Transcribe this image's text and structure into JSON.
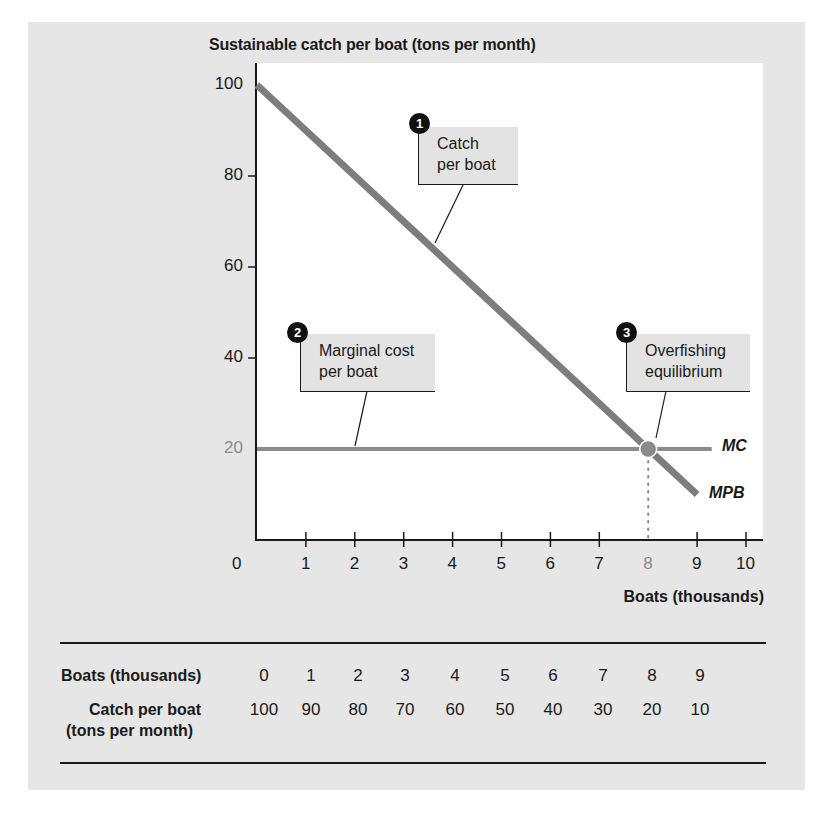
{
  "chart_data": {
    "type": "line",
    "title": "",
    "ylabel": "Sustainable catch per boat (tons per month)",
    "xlabel": "Boats (thousands)",
    "xlim": [
      0,
      10
    ],
    "ylim": [
      0,
      100
    ],
    "x_ticks": [
      "0",
      "1",
      "2",
      "3",
      "4",
      "5",
      "6",
      "7",
      "8",
      "9",
      "10"
    ],
    "y_ticks": [
      "100",
      "80",
      "60",
      "40",
      "20"
    ],
    "grid": false,
    "series": [
      {
        "name": "MPB",
        "x": [
          0,
          9
        ],
        "values": [
          100,
          10
        ],
        "color": "#7d7d7d"
      },
      {
        "name": "MC",
        "x": [
          0,
          9.3
        ],
        "values": [
          20,
          20
        ],
        "color": "#8c8c8c"
      }
    ],
    "equilibrium": {
      "x": 8,
      "y": 20
    },
    "annotations": [
      {
        "number": "1",
        "text_lines": [
          "Catch",
          "per boat"
        ]
      },
      {
        "number": "2",
        "text_lines": [
          "Marginal cost",
          "per boat"
        ]
      },
      {
        "number": "3",
        "text_lines": [
          "Overfishing",
          "equilibrium"
        ]
      }
    ],
    "table": {
      "row1_label": "Boats (thousands)",
      "row2_label": "Catch per boat",
      "row2_sublabel": "(tons per month)",
      "boats": [
        "0",
        "1",
        "2",
        "3",
        "4",
        "5",
        "6",
        "7",
        "8",
        "9"
      ],
      "catch": [
        "100",
        "90",
        "80",
        "70",
        "60",
        "50",
        "40",
        "30",
        "20",
        "10"
      ]
    }
  },
  "labels": {
    "ytitle": "Sustainable catch per boat (tons per month)",
    "xtitle": "Boats  (thousands)",
    "mc": "MC",
    "mpb": "MPB",
    "c1_num": "1",
    "c1_l1": "Catch",
    "c1_l2": "per boat",
    "c2_num": "2",
    "c2_l1": "Marginal cost",
    "c2_l2": "per boat",
    "c3_num": "3",
    "c3_l1": "Overfishing",
    "c3_l2": "equilibrium"
  }
}
